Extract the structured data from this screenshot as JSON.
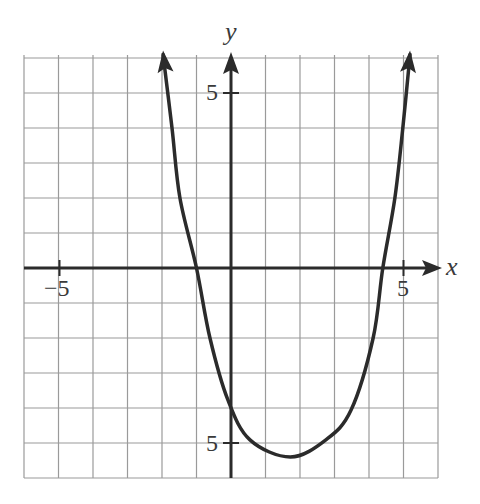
{
  "chart_data": {
    "type": "line",
    "title": "",
    "xlabel": "x",
    "ylabel": "y",
    "xlim": [
      -6,
      6
    ],
    "ylim": [
      -6,
      6.1
    ],
    "grid": true,
    "grid_step": 1,
    "x_ticks_labeled": [
      {
        "value": -5,
        "label": "−5"
      },
      {
        "value": 5,
        "label": "5"
      }
    ],
    "y_ticks_labeled": [
      {
        "value": 5,
        "label": "5"
      },
      {
        "value": -5,
        "label": "−5"
      }
    ],
    "series": [
      {
        "name": "parabola",
        "description": "Upward-opening parabola with arrows at both ends",
        "x": [
          -1.97,
          -1.71,
          -1.48,
          -1.0,
          -0.61,
          -0.09,
          0.55,
          1.72,
          2.75,
          3.48,
          4.12,
          4.4,
          4.75,
          4.98,
          5.19
        ],
        "y": [
          6.1,
          4.0,
          2.0,
          0.0,
          -2.0,
          -3.77,
          -4.91,
          -5.4,
          -4.91,
          -4.06,
          -2.0,
          0.0,
          2.0,
          4.0,
          6.1
        ],
        "x_intercepts": [
          -1.0,
          4.4
        ],
        "y_intercept": -4.0,
        "vertex": [
          1.7,
          -5.4
        ],
        "color": "#2b2b2b"
      }
    ],
    "colors": {
      "grid": "#9a9a9a",
      "axes": "#2b2b2b",
      "curve": "#2b2b2b",
      "background": "#ffffff"
    }
  },
  "labels": {
    "x_axis_name": "x",
    "y_axis_name": "y",
    "x_neg5": "−5",
    "x_pos5": "5",
    "y_pos5": "5",
    "y_neg5": "5"
  }
}
